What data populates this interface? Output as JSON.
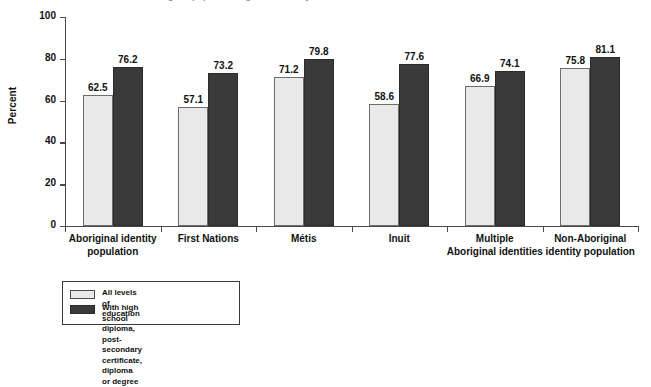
{
  "chart_data": {
    "type": "bar",
    "title": "",
    "xlabel": "",
    "ylabel": "Percent",
    "ylim": [
      0,
      100
    ],
    "yticks": [
      0,
      20,
      40,
      60,
      80,
      100
    ],
    "grid": false,
    "legend_position": "bottom-left",
    "categories": [
      "Aboriginal identity\npopulation",
      "First Nations",
      "Métis",
      "Inuit",
      "Multiple\nAboriginal identities",
      "Non-Aboriginal\nidentity population"
    ],
    "series": [
      {
        "name": "All levels of education",
        "color": "#e9e9e9",
        "values": [
          62.5,
          57.1,
          71.2,
          58.6,
          66.9,
          75.8
        ],
        "labels": [
          "62.5",
          "57.1",
          "71.2",
          "58.6",
          "66.9",
          "75.8"
        ]
      },
      {
        "name": "With high school diploma, post-secondary\ncertificate, diploma or degree",
        "color": "#3a3a3a",
        "values": [
          76.2,
          73.2,
          79.8,
          77.6,
          74.1,
          81.1
        ],
        "labels": [
          "76.2",
          "73.2",
          "79.8",
          "77.6",
          "74.1",
          "81.1"
        ]
      }
    ]
  },
  "axis": {
    "ylabel": "Percent",
    "ytick_labels": [
      "0",
      "20",
      "40",
      "60",
      "80",
      "100"
    ]
  },
  "legend": {
    "items": [
      {
        "label": "All levels of education",
        "swatch": "light"
      },
      {
        "label": "With high school diploma, post-secondary\ncertificate, diploma or degree",
        "swatch": "dark"
      }
    ]
  },
  "title_sliver": "Percentage of population aged 25 to 64 by educational attainment"
}
